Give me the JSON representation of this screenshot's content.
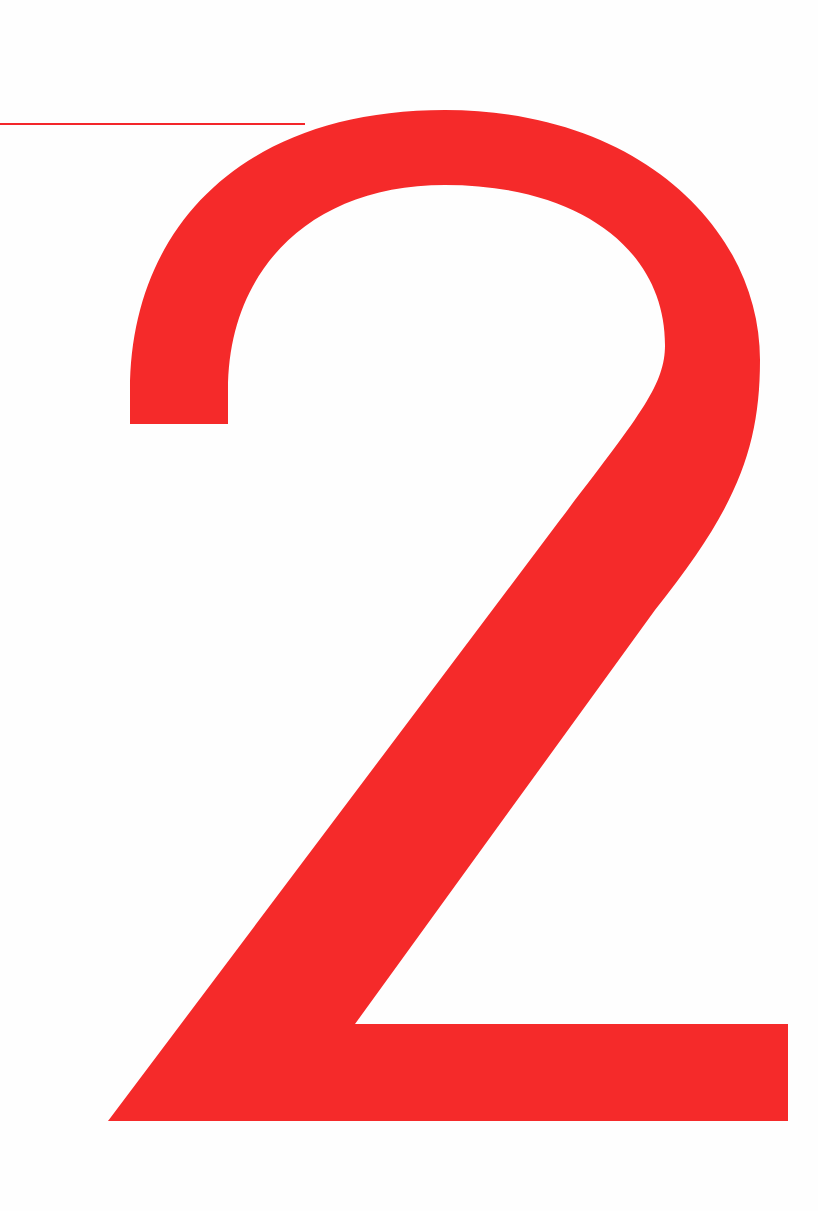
{
  "page": {
    "numeral": "2",
    "accent_color": "#f52a2a"
  }
}
